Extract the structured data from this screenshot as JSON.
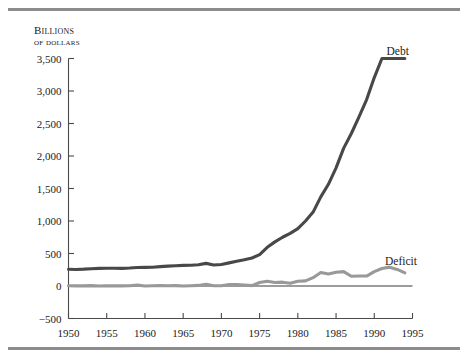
{
  "figure": {
    "axis_title_line1": "Billions",
    "axis_title_line2": "of dollars",
    "rule_color": "#8c8c8c"
  },
  "chart_data": {
    "type": "line",
    "title": "",
    "subtitle": "",
    "xlabel": "",
    "ylabel": "Billions of dollars",
    "xlim": [
      1950,
      1995
    ],
    "ylim": [
      -500,
      3500
    ],
    "xticks": [
      1950,
      1955,
      1960,
      1965,
      1970,
      1975,
      1980,
      1985,
      1990,
      1995
    ],
    "xtick_labels": [
      "1950",
      "1955",
      "1960",
      "1965",
      "1970",
      "1975",
      "1980",
      "1985",
      "1990",
      "1995"
    ],
    "yticks": [
      -500,
      0,
      500,
      1000,
      1500,
      2000,
      2500,
      3000,
      3500
    ],
    "ytick_labels": [
      "−500",
      "0",
      "500",
      "1,000",
      "1,500",
      "2,000",
      "2,500",
      "3,000",
      "3,500"
    ],
    "grid": false,
    "legend_position": "inline-end-of-line",
    "zero_line": true,
    "series": [
      {
        "name": "Debt",
        "label": "Debt",
        "color": "#484848",
        "line_width": 3.1,
        "label_x": 1991.6,
        "label_y": 3620,
        "x": [
          1950,
          1951,
          1952,
          1953,
          1954,
          1955,
          1956,
          1957,
          1958,
          1959,
          1960,
          1961,
          1962,
          1963,
          1964,
          1965,
          1966,
          1967,
          1968,
          1969,
          1970,
          1971,
          1972,
          1973,
          1974,
          1975,
          1976,
          1977,
          1978,
          1979,
          1980,
          1981,
          1982,
          1983,
          1984,
          1985,
          1986,
          1987,
          1988,
          1989,
          1990,
          1991,
          1992,
          1993,
          1994
        ],
        "y": [
          257,
          255,
          259,
          266,
          271,
          274,
          273,
          271,
          276,
          285,
          287,
          289,
          298,
          306,
          312,
          317,
          320,
          326,
          348,
          324,
          331,
          356,
          382,
          404,
          431,
          483,
          595,
          679,
          750,
          810,
          882,
          1000,
          1137,
          1372,
          1565,
          1818,
          2121,
          2346,
          2601,
          2868,
          3207,
          3598,
          3500,
          3500,
          3500
        ]
      },
      {
        "name": "Deficit",
        "label": "Deficit",
        "color": "#999999",
        "line_width": 3.1,
        "label_x": 1991.4,
        "label_y": 392,
        "x": [
          1950,
          1951,
          1952,
          1953,
          1954,
          1955,
          1956,
          1957,
          1958,
          1959,
          1960,
          1961,
          1962,
          1963,
          1964,
          1965,
          1966,
          1967,
          1968,
          1969,
          1970,
          1971,
          1972,
          1973,
          1974,
          1975,
          1976,
          1977,
          1978,
          1979,
          1980,
          1981,
          1982,
          1983,
          1984,
          1985,
          1986,
          1987,
          1988,
          1989,
          1990,
          1991,
          1992,
          1993,
          1994
        ],
        "y": [
          3,
          2,
          2,
          6,
          1,
          3,
          2,
          2,
          3,
          13,
          0,
          3,
          7,
          5,
          6,
          1,
          4,
          9,
          25,
          3,
          3,
          23,
          23,
          15,
          6,
          53,
          74,
          54,
          59,
          41,
          74,
          79,
          128,
          208,
          185,
          212,
          221,
          150,
          155,
          153,
          221,
          269,
          290,
          255,
          203
        ]
      }
    ],
    "annotations": []
  }
}
